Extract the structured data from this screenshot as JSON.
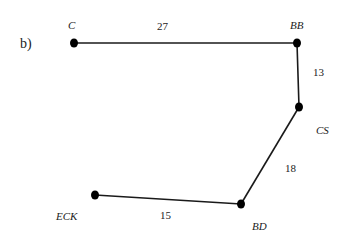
{
  "panel_label": "b)",
  "nodes": [
    {
      "id": "C",
      "label": "C",
      "x": 74,
      "y": 43,
      "lx": 68,
      "ly": 29
    },
    {
      "id": "BB",
      "label": "BB",
      "x": 297,
      "y": 43,
      "lx": 290,
      "ly": 29
    },
    {
      "id": "CS",
      "label": "CS",
      "x": 299,
      "y": 107,
      "lx": 316,
      "ly": 134
    },
    {
      "id": "BD",
      "label": "BD",
      "x": 241,
      "y": 204,
      "lx": 252,
      "ly": 230
    },
    {
      "id": "ECK",
      "label": "ECK",
      "x": 95,
      "y": 195,
      "lx": 56,
      "ly": 220
    }
  ],
  "edges": [
    {
      "from": "C",
      "to": "BB",
      "weight": "27",
      "wx": 157,
      "wy": 30
    },
    {
      "from": "BB",
      "to": "CS",
      "weight": "13",
      "wx": 313,
      "wy": 76
    },
    {
      "from": "CS",
      "to": "BD",
      "weight": "18",
      "wx": 285,
      "wy": 172
    },
    {
      "from": "BD",
      "to": "ECK",
      "weight": "15",
      "wx": 160,
      "wy": 219
    }
  ],
  "colors": {
    "line": "#1a1a1a",
    "node": "#000000",
    "text": "#222222"
  }
}
